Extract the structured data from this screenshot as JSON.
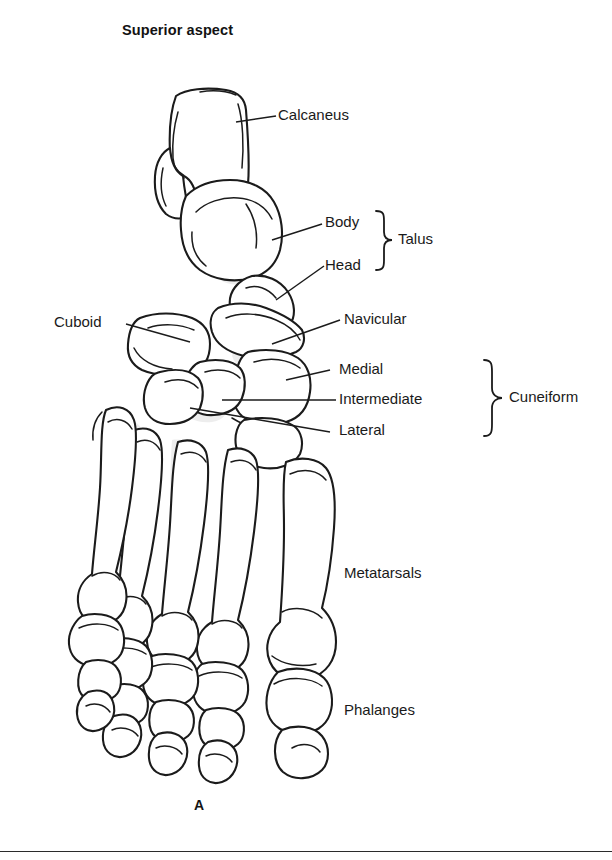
{
  "figure": {
    "title": "Superior aspect",
    "panel_label": "A",
    "view": "superior-aspect-foot-skeleton"
  },
  "labels": {
    "calcaneus": "Calcaneus",
    "talus_body": "Body",
    "talus_head": "Head",
    "talus_group": "Talus",
    "navicular": "Navicular",
    "cuboid": "Cuboid",
    "cuneiform_medial": "Medial",
    "cuneiform_intermediate": "Intermediate",
    "cuneiform_lateral": "Lateral",
    "cuneiform_group": "Cuneiform",
    "metatarsals": "Metatarsals",
    "phalanges": "Phalanges"
  },
  "colors": {
    "ink": "#1b1b1b",
    "text": "#1a1a1a",
    "shading": "#e7e7e7",
    "background": "#ffffff"
  }
}
